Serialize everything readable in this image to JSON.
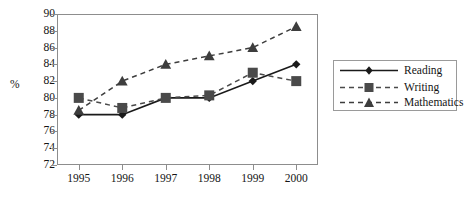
{
  "chart_data": {
    "type": "line",
    "title": "",
    "subtitle": "",
    "xlabel": "",
    "ylabel": "%",
    "categories": [
      "1995",
      "1996",
      "1997",
      "1998",
      "1999",
      "2000"
    ],
    "x": [
      1995,
      1996,
      1997,
      1998,
      1999,
      2000
    ],
    "ylim": [
      72,
      90
    ],
    "yticks": [
      72,
      74,
      76,
      78,
      80,
      82,
      84,
      86,
      88,
      90
    ],
    "ytick_labels": [
      "72",
      "74",
      "76",
      "78",
      "80",
      "82",
      "84",
      "86",
      "88",
      "90"
    ],
    "xtick_labels": [
      "1995",
      "1996",
      "1997",
      "1998",
      "1999",
      "2000"
    ],
    "grid": false,
    "legend_position": "right",
    "series": [
      {
        "name": "Reading",
        "values": [
          78,
          78,
          80,
          80,
          82,
          84
        ],
        "marker": "diamond",
        "line_style": "solid",
        "color": "#1a1a1a"
      },
      {
        "name": "Writing",
        "values": [
          80,
          78.8,
          80,
          80.3,
          83,
          82
        ],
        "marker": "square",
        "line_style": "dashed",
        "color": "#4a4a4a"
      },
      {
        "name": "Mathematics",
        "values": [
          78.5,
          82,
          84,
          85,
          86,
          88.5
        ],
        "marker": "triangle",
        "line_style": "dashed",
        "color": "#3d3d3d"
      }
    ]
  },
  "legend": {
    "items": [
      {
        "label": "Reading"
      },
      {
        "label": "Writing"
      },
      {
        "label": "Mathematics"
      }
    ]
  },
  "colors": {
    "frame": "#8d8d8d",
    "text": "#151515",
    "reading": "#1a1a1a",
    "writing": "#4a4a4a",
    "mathematics": "#3d3d3d",
    "background": "#ffffff"
  }
}
